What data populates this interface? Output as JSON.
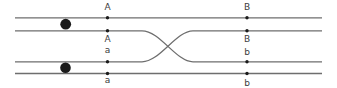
{
  "diagram": {
    "type": "chromosome-crossover-diagram",
    "canvas": {
      "width": 337,
      "height": 88,
      "background": "#ffffff"
    },
    "style": {
      "strand_color": "#6e6e6e",
      "strand_width": 1.3,
      "dot_color": "#1b1b1b",
      "dot_radius": 1.7,
      "centromere_color": "#1b1b1b",
      "label_color": "#3c3c3c",
      "label_font_size": 9
    },
    "strands": [
      {
        "name": "top-outer-chromatid",
        "d": "M 15 17.8 H 322"
      },
      {
        "name": "top-inner-chromatid",
        "d": "M 15 30.8 H 142 C 160 30.8 176 61.8 193 61.8 H 322"
      },
      {
        "name": "bottom-inner-chromatid",
        "d": "M 15 61.8 H 142 C 160 61.8 176 30.8 193 30.8 H 322"
      },
      {
        "name": "bottom-outer-chromatid",
        "d": "M 15 73.5 H 322"
      }
    ],
    "centromeres": [
      {
        "cx": 65.7,
        "cy": 24.2,
        "r": 5.4
      },
      {
        "cx": 65.5,
        "cy": 67.8,
        "r": 5.3
      }
    ],
    "loci": [
      {
        "label": "A",
        "dot_x": 107.5,
        "dot_y": 17.8,
        "text_x": 107.5,
        "text_y": 9.5
      },
      {
        "label": "B",
        "dot_x": 247.0,
        "dot_y": 17.8,
        "text_x": 247.0,
        "text_y": 9.5
      },
      {
        "label": "A",
        "dot_x": 107.5,
        "dot_y": 30.8,
        "text_x": 107.5,
        "text_y": 41.5
      },
      {
        "label": "B",
        "dot_x": 247.0,
        "dot_y": 30.8,
        "text_x": 247.0,
        "text_y": 41.5
      },
      {
        "label": "a",
        "dot_x": 107.5,
        "dot_y": 61.8,
        "text_x": 107.5,
        "text_y": 53.0
      },
      {
        "label": "b",
        "dot_x": 247.0,
        "dot_y": 61.8,
        "text_x": 247.0,
        "text_y": 55.0
      },
      {
        "label": "a",
        "dot_x": 107.5,
        "dot_y": 73.5,
        "text_x": 107.5,
        "text_y": 83.0
      },
      {
        "label": "b",
        "dot_x": 247.0,
        "dot_y": 73.5,
        "text_x": 247.0,
        "text_y": 85.5
      }
    ]
  }
}
